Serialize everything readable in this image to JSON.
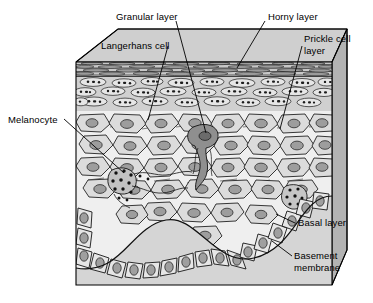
{
  "figure": {
    "background_color": "#ffffff"
  },
  "labels": [
    {
      "id": "granular-layer",
      "text": "Granular layer",
      "x": 116,
      "y": 11,
      "align": "left"
    },
    {
      "id": "horny-layer",
      "text": "Horny layer",
      "x": 268,
      "y": 11,
      "align": "left"
    },
    {
      "id": "langerhans-cell",
      "text": "Langerhans cell",
      "x": 101,
      "y": 40,
      "align": "left"
    },
    {
      "id": "prickle-cell-layer-line1",
      "text": "Prickle cell",
      "x": 304,
      "y": 34,
      "align": "left"
    },
    {
      "id": "prickle-cell-layer-line2",
      "text": "layer",
      "x": 304,
      "y": 46,
      "align": "left"
    },
    {
      "id": "melanocyte",
      "text": "Melanocyte",
      "x": 8,
      "y": 116,
      "align": "left"
    },
    {
      "id": "basal-layer",
      "text": "Basal layer",
      "x": 297,
      "y": 222,
      "align": "left"
    },
    {
      "id": "basement-membrane-line1",
      "text": "Basement",
      "x": 294,
      "y": 254,
      "align": "left"
    },
    {
      "id": "basement-membrane-line2",
      "text": "membrane",
      "x": 294,
      "y": 266,
      "align": "left"
    }
  ],
  "leader_lines": [
    {
      "id": "leader-granular-layer",
      "from": [
        174,
        20
      ],
      "to": [
        205,
        132
      ]
    },
    {
      "id": "leader-horny-layer",
      "from": [
        264,
        20
      ],
      "to": [
        236,
        67
      ]
    },
    {
      "id": "leader-prickle-cell-layer",
      "from": [
        301,
        46
      ],
      "to": [
        279,
        128
      ]
    },
    {
      "id": "leader-langerhans-cell",
      "from": [
        167,
        45
      ],
      "to": [
        148,
        118
      ]
    },
    {
      "id": "leader-melanocyte",
      "from": [
        63,
        119
      ],
      "to": [
        123,
        172
      ]
    },
    {
      "id": "leader-basal-layer",
      "from": [
        294,
        223
      ],
      "to": [
        274,
        214
      ]
    },
    {
      "id": "leader-basement-membrane",
      "from": [
        291,
        256
      ],
      "to": [
        273,
        241
      ]
    }
  ],
  "structure": {
    "block": {
      "top_face_color": "#cfcfcf",
      "right_face_color": "#b5b5b5",
      "front_face_color": "#e4e4e4",
      "dermis_color": "#d6d6d6",
      "outline_color": "#000000"
    },
    "layers": [
      {
        "id": "horny-layer",
        "label": "Horny layer",
        "y_top": 62,
        "y_bottom": 76,
        "fill": "#c9c9c9",
        "description": "flattened anucleate corneocyte sheets drawn as long horizontal lenses"
      },
      {
        "id": "granular-layer",
        "label": "Granular layer",
        "y_top": 76,
        "y_bottom": 112,
        "fill": "#d2d2d2",
        "description": "flattened cells containing dark keratohyalin granules"
      },
      {
        "id": "prickle-cell-layer",
        "label": "Prickle cell layer",
        "y_top": 112,
        "y_bottom": 215,
        "fill": "#ededed",
        "description": "polygonal spinous cells joined by desmosomal bridges"
      },
      {
        "id": "basal-layer",
        "label": "Basal layer",
        "y_top": 200,
        "y_bottom": 275,
        "fill": "#e8e8e8",
        "description": "single columnar layer resting on the basement membrane"
      },
      {
        "id": "basement-membrane",
        "label": "Basement membrane",
        "y_top": 205,
        "y_bottom": 280,
        "fill": "#d6d6d6",
        "description": "wavy line separating epidermis from dermis"
      }
    ],
    "special_cells": [
      {
        "id": "langerhans-cell",
        "label": "Langerhans cell",
        "cx": 205,
        "cy": 140,
        "fill": "#9a9a9a",
        "description": "dark dendritic cell in the prickle cell layer"
      },
      {
        "id": "melanocyte",
        "label": "Melanocyte",
        "cx": 127,
        "cy": 178,
        "fill": "#bdbdbd",
        "description": "basal dendritic cell with dark melanin granules"
      }
    ]
  }
}
